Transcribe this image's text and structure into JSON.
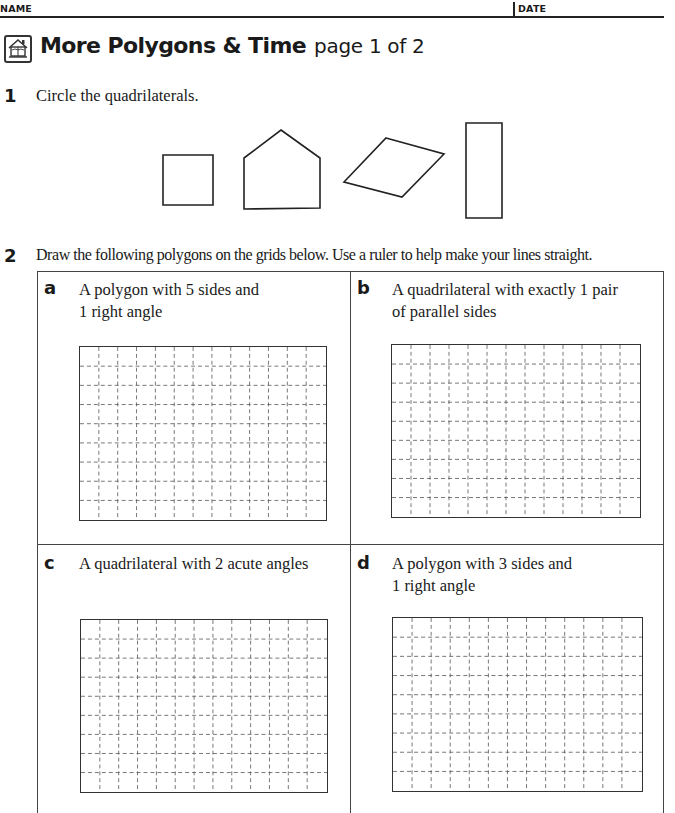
{
  "header": {
    "name_label": "NAME",
    "date_label": "DATE"
  },
  "title": {
    "icon": "home-connection-icon",
    "main": "More Polygons & Time",
    "sub": "page 1 of 2"
  },
  "question1": {
    "number": "1",
    "text": "Circle the quadrilaterals.",
    "shapes": [
      {
        "name": "square",
        "points": "163,155 213,155 213,205 163,205"
      },
      {
        "name": "pentagon",
        "points": "281,130 320,158 320,208 244,209 244,158"
      },
      {
        "name": "rhombus",
        "points": "386,138 444,154 402,197 344,182"
      },
      {
        "name": "rectangle",
        "points": "466,123 502,123 502,218 466,218"
      }
    ]
  },
  "question2": {
    "number": "2",
    "text": "Draw the following polygons on the grids below. Use a ruler to help make your lines straight.",
    "parts": [
      {
        "letter": "a",
        "line1": "A polygon with 5 sides and",
        "line2": "1 right angle"
      },
      {
        "letter": "b",
        "line1": "A quadrilateral with exactly 1 pair",
        "line2": "of parallel sides"
      },
      {
        "letter": "c",
        "line1": "A quadrilateral with 2 acute angles",
        "line2": ""
      },
      {
        "letter": "d",
        "line1": "A polygon with 3 sides and",
        "line2": "1 right angle"
      }
    ],
    "grid": {
      "columns": 13,
      "rows": 9
    }
  }
}
